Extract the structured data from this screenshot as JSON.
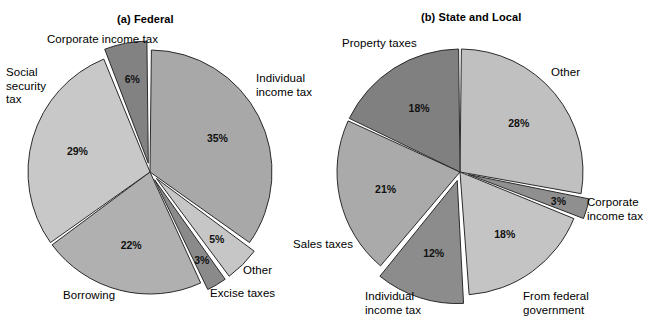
{
  "figure": {
    "width": 661,
    "height": 335,
    "background": "#ffffff"
  },
  "charts": [
    {
      "id": "federal",
      "title": "(a) Federal",
      "center": [
        150,
        172
      ],
      "radius": 122,
      "labels": [
        {
          "name": "corporate-income-tax",
          "text": "Corporate income tax",
          "x": 47,
          "y": 33,
          "align": "left"
        },
        {
          "name": "social-security-tax",
          "text": "Social\nsecurity\ntax",
          "x": 6,
          "y": 66,
          "align": "left"
        },
        {
          "name": "individual-income-tax",
          "text": "Individual\nincome tax",
          "x": 256,
          "y": 72,
          "align": "left"
        },
        {
          "name": "other",
          "text": "Other",
          "x": 243,
          "y": 264,
          "align": "left"
        },
        {
          "name": "excise-taxes",
          "text": "Excise taxes",
          "x": 210,
          "y": 287,
          "align": "left"
        },
        {
          "name": "borrowing",
          "text": "Borrowing",
          "x": 63,
          "y": 289,
          "align": "left"
        }
      ]
    },
    {
      "id": "state-and-local",
      "title": "(b) State and Local",
      "center": [
        460,
        172
      ],
      "radius": 123,
      "labels": [
        {
          "name": "property-taxes",
          "text": "Property taxes",
          "x": 342,
          "y": 37,
          "align": "left"
        },
        {
          "name": "other",
          "text": "Other",
          "x": 551,
          "y": 66,
          "align": "left"
        },
        {
          "name": "corporate-income-tax",
          "text": "Corporate\nincome tax",
          "x": 587,
          "y": 196,
          "align": "left"
        },
        {
          "name": "from-federal-government",
          "text": "From federal\ngovernment",
          "x": 523,
          "y": 290,
          "align": "left"
        },
        {
          "name": "individual-income-tax",
          "text": "Individual\nincome tax",
          "x": 365,
          "y": 290,
          "align": "left"
        },
        {
          "name": "sales-taxes",
          "text": "Sales taxes",
          "x": 293,
          "y": 238,
          "align": "left"
        }
      ]
    }
  ],
  "chart_data": [
    {
      "type": "pie",
      "title": "(a) Federal",
      "subtitle": "",
      "xlabel": "",
      "ylabel": "",
      "legend": "none (direct labels)",
      "grid": false,
      "total": 100,
      "units": "percent",
      "categories": [
        "Individual income tax",
        "Other",
        "Excise taxes",
        "Borrowing",
        "Social security tax",
        "Corporate income tax"
      ],
      "values": [
        35,
        5,
        3,
        22,
        29,
        6
      ],
      "value_labels": [
        "35%",
        "5%",
        "3%",
        "22%",
        "29%",
        "6%"
      ],
      "slices": [
        {
          "label": "Individual income tax",
          "value": 35,
          "value_label": "35%",
          "color": "#a8a8a8",
          "exploded": false,
          "start_deg": 0,
          "end_deg": 126
        },
        {
          "label": "Other",
          "value": 5,
          "value_label": "5%",
          "color": "#c6c6c6",
          "exploded": true,
          "start_deg": 126,
          "end_deg": 144
        },
        {
          "label": "Excise taxes",
          "value": 3,
          "value_label": "3%",
          "color": "#8a8a8a",
          "exploded": true,
          "start_deg": 144,
          "end_deg": 154.8
        },
        {
          "label": "Borrowing",
          "value": 22,
          "value_label": "22%",
          "color": "#b0b0b0",
          "exploded": false,
          "start_deg": 154.8,
          "end_deg": 234
        },
        {
          "label": "Social security tax",
          "value": 29,
          "value_label": "29%",
          "color": "#c8c8c8",
          "exploded": false,
          "start_deg": 234,
          "end_deg": 338.4
        },
        {
          "label": "Corporate income tax",
          "value": 6,
          "value_label": "6%",
          "color": "#828282",
          "exploded": true,
          "start_deg": 338.4,
          "end_deg": 360
        }
      ]
    },
    {
      "type": "pie",
      "title": "(b) State and Local",
      "subtitle": "",
      "xlabel": "",
      "ylabel": "",
      "legend": "none (direct labels)",
      "grid": false,
      "total": 100,
      "units": "percent",
      "categories": [
        "Other",
        "Corporate income tax",
        "From federal government",
        "Individual income tax",
        "Sales taxes",
        "Property taxes"
      ],
      "values": [
        28,
        3,
        18,
        12,
        21,
        18
      ],
      "value_labels": [
        "28%",
        "3%",
        "18%",
        "12%",
        "21%",
        "18%"
      ],
      "slices": [
        {
          "label": "Other",
          "value": 28,
          "value_label": "28%",
          "color": "#c0c0c0",
          "exploded": false,
          "start_deg": 0,
          "end_deg": 100.8
        },
        {
          "label": "Corporate income tax",
          "value": 3,
          "value_label": "3%",
          "color": "#8f8f8f",
          "exploded": true,
          "start_deg": 100.8,
          "end_deg": 111.6
        },
        {
          "label": "From federal government",
          "value": 18,
          "value_label": "18%",
          "color": "#c4c4c4",
          "exploded": false,
          "start_deg": 111.6,
          "end_deg": 176.4
        },
        {
          "label": "Individual income tax",
          "value": 12,
          "value_label": "12%",
          "color": "#8c8c8c",
          "exploded": true,
          "start_deg": 176.4,
          "end_deg": 219.6
        },
        {
          "label": "Sales taxes",
          "value": 21,
          "value_label": "21%",
          "color": "#aaaaaa",
          "exploded": false,
          "start_deg": 219.6,
          "end_deg": 295.2
        },
        {
          "label": "Property taxes",
          "value": 18,
          "value_label": "18%",
          "color": "#808080",
          "exploded": false,
          "start_deg": 295.2,
          "end_deg": 360
        }
      ]
    }
  ],
  "colors": {
    "outline": "#2b2b2b",
    "gap": "#ffffff",
    "text": "#000000"
  }
}
